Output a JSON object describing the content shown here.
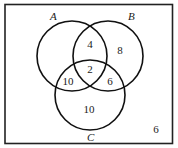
{
  "diagram": {
    "type": "venn-3",
    "colors": {
      "stroke": "#111111",
      "background": "#ffffff",
      "text": "#1a1a1a"
    },
    "sets": [
      {
        "id": "A",
        "label": "A",
        "cx": 72,
        "cy": 56,
        "r": 35,
        "label_x": 50,
        "label_y": 20
      },
      {
        "id": "B",
        "label": "B",
        "cx": 108,
        "cy": 56,
        "r": 35,
        "label_x": 128,
        "label_y": 20
      },
      {
        "id": "C",
        "label": "C",
        "cx": 90,
        "cy": 95,
        "r": 35,
        "label_x": 87,
        "label_y": 141
      }
    ],
    "regions": {
      "A_and_B_only": {
        "value": "4",
        "x": 90,
        "y": 48
      },
      "B_only": {
        "value": "8",
        "x": 120,
        "y": 54
      },
      "A_and_B_and_C": {
        "value": "2",
        "x": 90,
        "y": 73
      },
      "A_and_C_only": {
        "value": "10",
        "x": 68,
        "y": 85
      },
      "B_and_C_only": {
        "value": "6",
        "x": 110,
        "y": 85
      },
      "C_only": {
        "value": "10",
        "x": 89,
        "y": 113
      },
      "outside": {
        "value": "6",
        "x": 156,
        "y": 133
      }
    }
  }
}
